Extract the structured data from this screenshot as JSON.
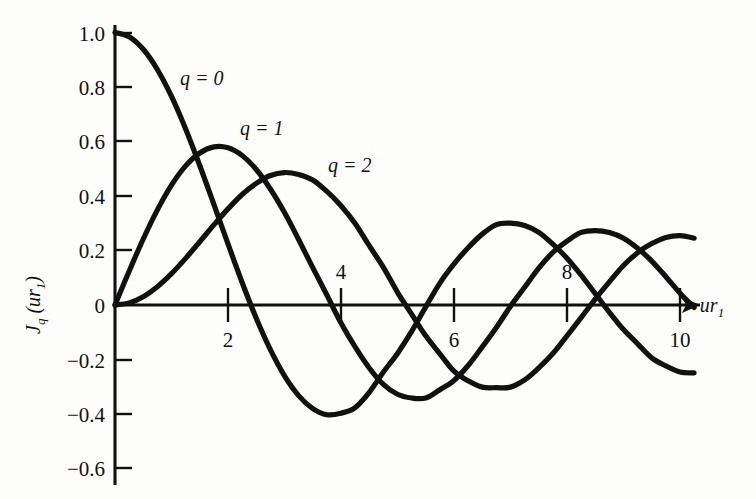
{
  "figure": {
    "background_color": "#fdfdfc",
    "ink_color": "#111111",
    "y_axis_title": "J",
    "y_axis_title_sub": "q",
    "y_axis_title_arg": " (ur",
    "y_axis_title_arg_sub": "1",
    "y_axis_title_arg_close": ")",
    "x_axis_title": "ur",
    "x_axis_title_sub": "1"
  },
  "labels": {
    "q0": "q = 0",
    "q1": "q = 1",
    "q2": "q = 2",
    "ytick_1_0": "1.0",
    "ytick_0_8": "0.8",
    "ytick_0_6": "0.6",
    "ytick_0_4": "0.4",
    "ytick_0_2": "0.2",
    "ytick_0": "0",
    "ytick_m0_2": "−0.2",
    "ytick_m0_4": "−0.4",
    "ytick_m0_6": "−0.6",
    "xtick_2": "2",
    "xtick_4": "4",
    "xtick_6": "6",
    "xtick_8": "8",
    "xtick_10": "10"
  },
  "chart_data": {
    "type": "line",
    "title": "",
    "xlabel": "ur₁",
    "ylabel": "J_q (ur₁)",
    "xlim": [
      0,
      10.4
    ],
    "ylim": [
      -0.65,
      1.05
    ],
    "grid": false,
    "legend": "inline-annotations",
    "xticks": [
      2,
      4,
      6,
      8,
      10
    ],
    "xtick_label_side": [
      "below",
      "above",
      "below",
      "above",
      "below"
    ],
    "yticks": [
      1.0,
      0.8,
      0.6,
      0.4,
      0.2,
      0,
      -0.2,
      -0.4,
      -0.6
    ],
    "x": [
      0,
      0.25,
      0.5,
      0.75,
      1.0,
      1.25,
      1.5,
      1.75,
      2.0,
      2.25,
      2.5,
      2.75,
      3.0,
      3.25,
      3.5,
      3.75,
      4.0,
      4.25,
      4.5,
      4.75,
      5.0,
      5.25,
      5.5,
      5.75,
      6.0,
      6.25,
      6.5,
      6.75,
      7.0,
      7.25,
      7.5,
      7.75,
      8.0,
      8.25,
      8.5,
      8.75,
      9.0,
      9.25,
      9.5,
      9.75,
      10.0,
      10.25
    ],
    "series": [
      {
        "name": "q = 0",
        "label": "q = 0",
        "values": [
          1.0,
          0.9844,
          0.9385,
          0.8642,
          0.7652,
          0.6459,
          0.5118,
          0.369,
          0.2239,
          0.0827,
          -0.0484,
          -0.1641,
          -0.2601,
          -0.3325,
          -0.3801,
          -0.4026,
          -0.3971,
          -0.3766,
          -0.3205,
          -0.2459,
          -0.1776,
          -0.0968,
          -0.0068,
          0.0802,
          0.1506,
          0.2101,
          0.2601,
          0.2951,
          0.3001,
          0.2916,
          0.2663,
          0.2235,
          0.1717,
          0.1096,
          0.0419,
          -0.0271,
          -0.0903,
          -0.1424,
          -0.1939,
          -0.2235,
          -0.2459,
          -0.249
        ]
      },
      {
        "name": "q = 1",
        "label": "q = 1",
        "values": [
          0.0,
          0.124,
          0.2423,
          0.3492,
          0.4401,
          0.5106,
          0.5579,
          0.5802,
          0.5767,
          0.5484,
          0.4971,
          0.4256,
          0.3391,
          0.2403,
          0.1374,
          0.0365,
          -0.066,
          -0.1538,
          -0.2311,
          -0.2913,
          -0.3276,
          -0.3414,
          -0.3414,
          -0.311,
          -0.2767,
          -0.2222,
          -0.1538,
          -0.0826,
          -0.0047,
          0.0651,
          0.1352,
          0.1934,
          0.2346,
          0.2663,
          0.2731,
          0.2661,
          0.2453,
          0.2083,
          0.1613,
          0.1039,
          0.0435,
          -0.009
        ]
      },
      {
        "name": "q = 2",
        "label": "q = 2",
        "values": [
          0.0,
          0.0078,
          0.0306,
          0.0671,
          0.1149,
          0.1711,
          0.2321,
          0.294,
          0.3528,
          0.4054,
          0.4461,
          0.4751,
          0.4861,
          0.479,
          0.4586,
          0.4167,
          0.3641,
          0.2991,
          0.2178,
          0.1384,
          0.0466,
          -0.0337,
          -0.113,
          -0.179,
          -0.2429,
          -0.2783,
          -0.3014,
          -0.3034,
          -0.3014,
          -0.2751,
          -0.2306,
          -0.1783,
          -0.113,
          -0.0462,
          0.0218,
          0.085,
          0.1448,
          0.1918,
          0.2254,
          0.2476,
          0.2546,
          0.2451
        ]
      }
    ]
  }
}
